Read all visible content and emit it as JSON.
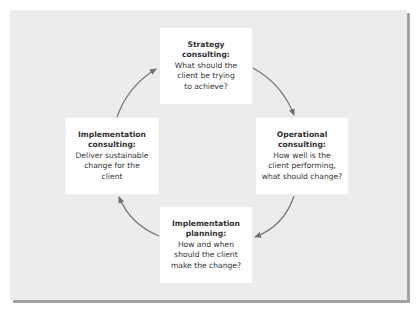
{
  "diagram": {
    "type": "cycle",
    "colors": {
      "panel_background": "#ececec",
      "box_background": "#ffffff",
      "arrow": "#707070",
      "shadow": "#a3a3a3",
      "text": "#333333"
    },
    "nodes": [
      {
        "id": "strategy",
        "title_lines": [
          "Strategy",
          "consulting:"
        ],
        "body_lines": [
          "What should the",
          "client be trying",
          "to achieve?"
        ]
      },
      {
        "id": "operational",
        "title_lines": [
          "Operational",
          "consulting:"
        ],
        "body_lines": [
          "How well is the",
          "client performing,",
          "what should change?"
        ]
      },
      {
        "id": "implementation-planning",
        "title_lines": [
          "Implementation",
          "planning:"
        ],
        "body_lines": [
          "How and when",
          "should the client",
          "make the change?"
        ]
      },
      {
        "id": "implementation-consulting",
        "title_lines": [
          "Implementation",
          "consulting:"
        ],
        "body_lines": [
          "Deliver sustainable",
          "change for the",
          "client"
        ]
      }
    ],
    "edges": [
      {
        "from": "strategy",
        "to": "operational"
      },
      {
        "from": "operational",
        "to": "implementation-planning"
      },
      {
        "from": "implementation-planning",
        "to": "implementation-consulting"
      },
      {
        "from": "implementation-consulting",
        "to": "strategy"
      }
    ]
  }
}
